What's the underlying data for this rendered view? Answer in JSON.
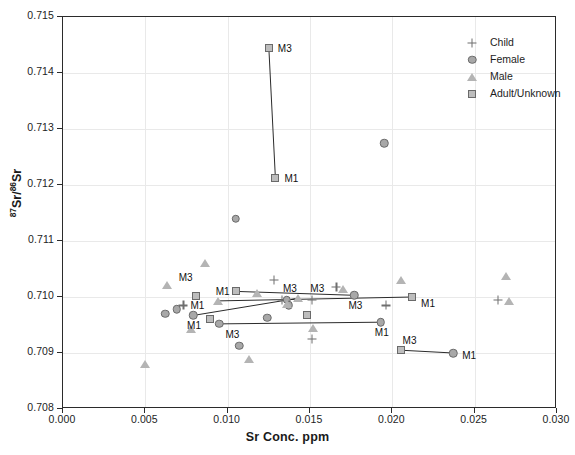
{
  "chart_data": {
    "type": "scatter",
    "title": "",
    "xlabel": "Sr Conc. ppm",
    "ylabel": "87Sr/86Sr",
    "ylabel_parts": {
      "sup1": "87",
      "mid": "Sr/",
      "sup2": "86",
      "end": "Sr"
    },
    "xlim": [
      0.0,
      0.03
    ],
    "ylim": [
      0.708,
      0.715
    ],
    "xticks": [
      0.0,
      0.005,
      0.01,
      0.015,
      0.02,
      0.025,
      0.03
    ],
    "xtick_labels": [
      "0.000",
      "0.005",
      "0.010",
      "0.015",
      "0.020",
      "0.025",
      "0.030"
    ],
    "yticks": [
      0.708,
      0.709,
      0.71,
      0.711,
      0.712,
      0.713,
      0.714,
      0.715
    ],
    "ytick_labels": [
      "0.708",
      "0.709",
      "0.710",
      "0.711",
      "0.712",
      "0.713",
      "0.714",
      "0.715"
    ],
    "grid": true,
    "legend_position": "top-right",
    "legend": [
      {
        "label": "Child",
        "marker": "plus-marker"
      },
      {
        "label": "Female",
        "marker": "circle-marker"
      },
      {
        "label": "Male",
        "marker": "triangle-marker"
      },
      {
        "label": "Adult/Unknown",
        "marker": "square-marker"
      }
    ],
    "series": [
      {
        "name": "Child",
        "marker": "plus-marker",
        "points": [
          {
            "x": 0.0073,
            "y": 0.70985,
            "label": ""
          },
          {
            "x": 0.0128,
            "y": 0.7103,
            "label": ""
          },
          {
            "x": 0.0133,
            "y": 0.70995,
            "label": ""
          },
          {
            "x": 0.0151,
            "y": 0.70995,
            "label": ""
          },
          {
            "x": 0.0166,
            "y": 0.71018,
            "label": ""
          },
          {
            "x": 0.0151,
            "y": 0.70925,
            "label": ""
          },
          {
            "x": 0.0196,
            "y": 0.70985,
            "label": ""
          },
          {
            "x": 0.0264,
            "y": 0.70995,
            "label": ""
          }
        ]
      },
      {
        "name": "Female",
        "marker": "circle-marker",
        "points": [
          {
            "x": 0.0062,
            "y": 0.7097,
            "label": ""
          },
          {
            "x": 0.0069,
            "y": 0.70978,
            "label": ""
          },
          {
            "x": 0.0079,
            "y": 0.70967,
            "label": "M1"
          },
          {
            "x": 0.0095,
            "y": 0.70952,
            "label": "M3"
          },
          {
            "x": 0.0105,
            "y": 0.7114,
            "label": ""
          },
          {
            "x": 0.0107,
            "y": 0.70913,
            "label": ""
          },
          {
            "x": 0.0124,
            "y": 0.70963,
            "label": ""
          },
          {
            "x": 0.0136,
            "y": 0.70995,
            "label": ""
          },
          {
            "x": 0.0137,
            "y": 0.70985,
            "label": ""
          },
          {
            "x": 0.0177,
            "y": 0.71003,
            "label": "M3"
          },
          {
            "x": 0.0193,
            "y": 0.70955,
            "label": "M1"
          },
          {
            "x": 0.0195,
            "y": 0.71275,
            "label": ""
          },
          {
            "x": 0.0237,
            "y": 0.709,
            "label": "M1"
          }
        ]
      },
      {
        "name": "Male",
        "marker": "triangle-marker",
        "points": [
          {
            "x": 0.005,
            "y": 0.7088,
            "label": ""
          },
          {
            "x": 0.0063,
            "y": 0.71022,
            "label": ""
          },
          {
            "x": 0.0078,
            "y": 0.70942,
            "label": ""
          },
          {
            "x": 0.0086,
            "y": 0.7106,
            "label": ""
          },
          {
            "x": 0.0094,
            "y": 0.70993,
            "label": "M1"
          },
          {
            "x": 0.0113,
            "y": 0.7089,
            "label": ""
          },
          {
            "x": 0.0118,
            "y": 0.71008,
            "label": ""
          },
          {
            "x": 0.0136,
            "y": 0.70988,
            "label": ""
          },
          {
            "x": 0.0143,
            "y": 0.70998,
            "label": "M3"
          },
          {
            "x": 0.0152,
            "y": 0.70945,
            "label": ""
          },
          {
            "x": 0.017,
            "y": 0.71015,
            "label": ""
          },
          {
            "x": 0.0205,
            "y": 0.7103,
            "label": ""
          },
          {
            "x": 0.0269,
            "y": 0.71037,
            "label": ""
          },
          {
            "x": 0.0271,
            "y": 0.70993,
            "label": ""
          }
        ]
      },
      {
        "name": "Adult/Unknown",
        "marker": "square-marker",
        "points": [
          {
            "x": 0.0081,
            "y": 0.71002,
            "label": ""
          },
          {
            "x": 0.0089,
            "y": 0.7096,
            "label": ""
          },
          {
            "x": 0.0105,
            "y": 0.7101,
            "label": ""
          },
          {
            "x": 0.0125,
            "y": 0.71445,
            "label": "M3"
          },
          {
            "x": 0.0129,
            "y": 0.71212,
            "label": "M1"
          },
          {
            "x": 0.0148,
            "y": 0.70967,
            "label": ""
          },
          {
            "x": 0.0205,
            "y": 0.70905,
            "label": "M3"
          },
          {
            "x": 0.0212,
            "y": 0.71,
            "label": "M1"
          }
        ]
      }
    ],
    "connectors": [
      {
        "x1": 0.0125,
        "y1": 0.71445,
        "x2": 0.0129,
        "y2": 0.71212
      },
      {
        "x1": 0.0094,
        "y1": 0.70993,
        "x2": 0.0212,
        "y2": 0.71
      },
      {
        "x1": 0.0105,
        "y1": 0.7101,
        "x2": 0.0177,
        "y2": 0.71003
      },
      {
        "x1": 0.0079,
        "y1": 0.70967,
        "x2": 0.0143,
        "y2": 0.70998
      },
      {
        "x1": 0.0095,
        "y1": 0.70952,
        "x2": 0.0193,
        "y2": 0.70955
      },
      {
        "x1": 0.0205,
        "y1": 0.70905,
        "x2": 0.0237,
        "y2": 0.709
      }
    ],
    "point_labels": [
      {
        "x": 0.0125,
        "y": 0.71445,
        "text": "M3",
        "dx": 9,
        "dy": 0
      },
      {
        "x": 0.0129,
        "y": 0.71212,
        "text": "M1",
        "dx": 9,
        "dy": 0
      },
      {
        "x": 0.0063,
        "y": 0.71022,
        "text": "M3",
        "dx": 12,
        "dy": -8
      },
      {
        "x": 0.0094,
        "y": 0.70993,
        "text": "M1",
        "dx": -2,
        "dy": -10
      },
      {
        "x": 0.0081,
        "y": 0.71002,
        "text": "M1",
        "dx": -6,
        "dy": 9
      },
      {
        "x": 0.0079,
        "y": 0.70967,
        "text": "M1",
        "dx": -6,
        "dy": 10
      },
      {
        "x": 0.0095,
        "y": 0.70952,
        "text": "M3",
        "dx": 6,
        "dy": 10
      },
      {
        "x": 0.0136,
        "y": 0.71,
        "text": "M3",
        "dx": -4,
        "dy": -9
      },
      {
        "x": 0.0149,
        "y": 0.71,
        "text": "M3",
        "dx": 2,
        "dy": -9
      },
      {
        "x": 0.0177,
        "y": 0.71003,
        "text": "M3",
        "dx": -6,
        "dy": 10
      },
      {
        "x": 0.0212,
        "y": 0.71,
        "text": "M1",
        "dx": 9,
        "dy": 6
      },
      {
        "x": 0.0193,
        "y": 0.70955,
        "text": "M1",
        "dx": -6,
        "dy": 10
      },
      {
        "x": 0.0205,
        "y": 0.70905,
        "text": "M3",
        "dx": 2,
        "dy": -10
      },
      {
        "x": 0.0237,
        "y": 0.709,
        "text": "M1",
        "dx": 9,
        "dy": 2
      }
    ]
  }
}
